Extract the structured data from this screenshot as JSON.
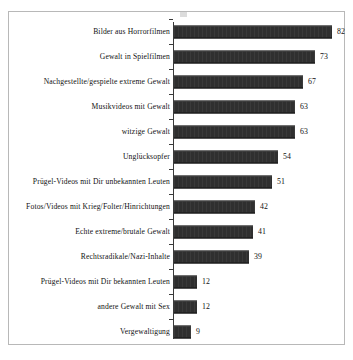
{
  "frame": {
    "border_color": "#b8b8b8",
    "background": "#ffffff"
  },
  "chart_data": {
    "type": "bar",
    "orientation": "horizontal",
    "title": "",
    "subtitle": "",
    "xlabel": "",
    "ylabel": "",
    "xlim": [
      0,
      85
    ],
    "grid": false,
    "legend": false,
    "bar_color": "#2f2f2f",
    "axis_color": "#3a3a3a",
    "data_labels": true,
    "categories": [
      "Bilder aus Horrorfilmen",
      "Gewalt in Spielfilmen",
      "Nachgestellte/gespielte extreme Gewalt",
      "Musikvideos mit Gewalt",
      "witzige Gewalt",
      "Unglücksopfer",
      "Prügel-Videos mit Dir unbekannten Leuten",
      "Fotos/Videos mit Krieg/Folter/Hinrichtungen",
      "Echte extreme/brutale Gewalt",
      "Rechtsradikale/Nazi-Inhalte",
      "Prügel-Videos mit Dir bekannten Leuten",
      "andere Gewalt mit Sex",
      "Vergewaltigung"
    ],
    "values": [
      82,
      73,
      67,
      63,
      63,
      54,
      51,
      42,
      41,
      39,
      12,
      12,
      9
    ],
    "value_labels": [
      "82",
      "73",
      "67",
      "63",
      "63",
      "54",
      "51",
      "42",
      "41",
      "39",
      "12",
      "12",
      "9"
    ]
  }
}
